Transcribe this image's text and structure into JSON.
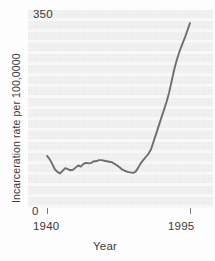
{
  "chart_data": {
    "type": "line",
    "title": "",
    "xlabel": "Year",
    "ylabel": "Incarceration rate per 100,0000",
    "xlim": [
      1940,
      1995
    ],
    "ylim": [
      0,
      350
    ],
    "xtick_labels": [
      "1940",
      "1995"
    ],
    "ytick_labels": [
      "0",
      "350"
    ],
    "grid": "horizontal",
    "legend": "none",
    "series": [
      {
        "name": "Incarceration rate",
        "x": [
          1940,
          1941,
          1942,
          1943,
          1944,
          1945,
          1946,
          1947,
          1948,
          1949,
          1950,
          1951,
          1952,
          1953,
          1954,
          1955,
          1956,
          1957,
          1958,
          1959,
          1960,
          1961,
          1962,
          1963,
          1964,
          1965,
          1966,
          1967,
          1968,
          1969,
          1970,
          1971,
          1972,
          1973,
          1974,
          1975,
          1976,
          1977,
          1978,
          1979,
          1980,
          1981,
          1982,
          1983,
          1984,
          1985,
          1986,
          1987,
          1988,
          1989,
          1990,
          1991,
          1992,
          1993,
          1994,
          1995
        ],
        "values": [
          98,
          92,
          83,
          73,
          68,
          65,
          70,
          75,
          73,
          71,
          72,
          76,
          80,
          78,
          83,
          85,
          84,
          85,
          88,
          88,
          90,
          90,
          89,
          88,
          87,
          86,
          83,
          80,
          76,
          72,
          70,
          68,
          67,
          66,
          68,
          75,
          84,
          90,
          96,
          102,
          110,
          125,
          140,
          155,
          170,
          185,
          200,
          218,
          240,
          262,
          280,
          295,
          308,
          320,
          334,
          348
        ]
      }
    ],
    "colors": {
      "line": "#6e6e6e",
      "plot_background": "#f2f2f2",
      "gridline": "#fafafa",
      "text": "#3b3b3b"
    }
  }
}
